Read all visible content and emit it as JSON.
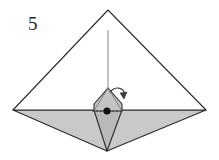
{
  "figure": {
    "kind": "origami-fold-step-diagram",
    "step_label": "5",
    "canvas": {
      "width": 219,
      "height": 160
    },
    "colors": {
      "background": "#ffffff",
      "paper_front": "#ffffff",
      "paper_back_light": "#c9c9c9",
      "paper_back_mid": "#bcbcbc",
      "paper_back_dark": "#b4b4b4",
      "outline": "#2b2b2b",
      "crease_line": "#8a8a8a",
      "dot_fill": "#111111",
      "arrow_stroke": "#3a3a3a"
    },
    "geometry": {
      "apex_top": [
        108,
        10
      ],
      "vertex_left": [
        13,
        110
      ],
      "vertex_right": [
        206,
        110
      ],
      "vertex_bottom": [
        107,
        151
      ],
      "center_point": [
        107,
        111
      ],
      "inner_kite_apex": [
        108,
        88
      ],
      "inner_kite_left": [
        94,
        110
      ],
      "inner_kite_right": [
        122,
        110
      ],
      "horizontal_axis_y": 111,
      "vertical_crease_x": 108,
      "vertical_crease_top_y": 30,
      "vertical_crease_bottom_y": 88
    },
    "annotations": {
      "pivot_dot": "reference point at center of model",
      "rotation_arrow": "small curved fold arrow at upper right of inner kite",
      "vertical_dashed_crease": "thin vertical reference line descending from top apex",
      "horizontal_axis": "dotted horizontal reference line through center point"
    }
  }
}
